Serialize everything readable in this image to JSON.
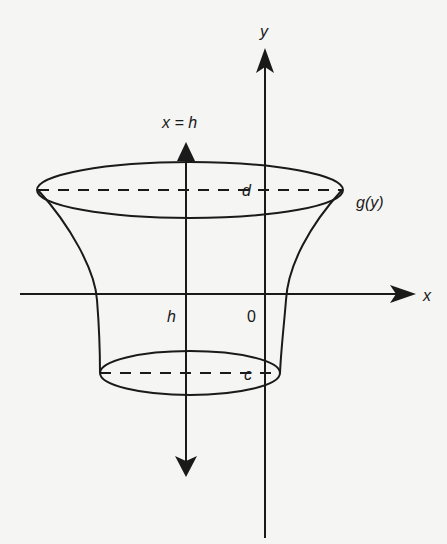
{
  "figure": {
    "labels": {
      "y_axis": "y",
      "x_axis": "x",
      "axis_of_rotation": "x = h",
      "upper_bound": "d",
      "lower_bound": "c",
      "curve": "g(y)",
      "h_marker": "h",
      "origin": "0"
    },
    "colors": {
      "stroke": "#1a1a1a",
      "background": "#f5f5f3"
    }
  }
}
